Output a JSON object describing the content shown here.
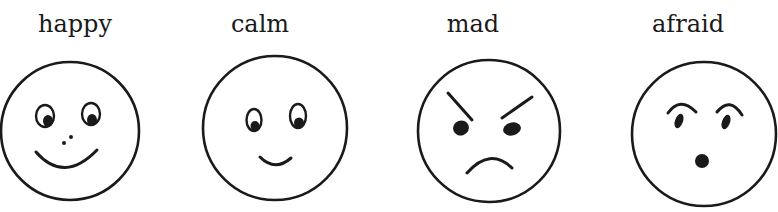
{
  "faces": [
    {
      "label": "happy",
      "emotion": "happy",
      "label_center_x": 75
    },
    {
      "label": "calm",
      "emotion": "calm",
      "label_center_x": 260
    },
    {
      "label": "mad",
      "emotion": "mad",
      "label_center_x": 473
    },
    {
      "label": "afraid",
      "emotion": "afraid",
      "label_center_x": 688
    }
  ],
  "colors": {
    "ink": "#1a1a1a",
    "background": "#ffffff"
  }
}
